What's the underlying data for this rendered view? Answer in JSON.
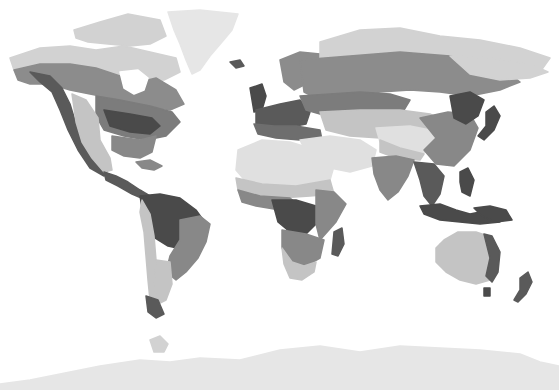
{
  "map": {
    "type": "world-climate-zones-grayscale",
    "background": "#ffffff",
    "palette": {
      "ice": "#e6e6e6",
      "tundra": "#d2d2d2",
      "desert": "#e0e0e0",
      "steppe": "#c4c4c4",
      "temperate": "#9a9a9a",
      "boreal": "#8c8c8c",
      "continental": "#7c7c7c",
      "savanna": "#888888",
      "tropical": "#4a4a4a",
      "mountain": "#5a5a5a",
      "mediterranean": "#6e6e6e"
    },
    "regions": [
      {
        "name": "greenland",
        "zone": "ice",
        "points": "168,12 200,10 238,14 232,30 222,42 210,56 200,70 192,74 186,60 180,44 174,30"
      },
      {
        "name": "canadian-arctic-islands",
        "zone": "tundra",
        "points": "74,30 100,22 128,14 160,20 166,36 150,44 130,46 108,44 88,42 76,38"
      },
      {
        "name": "north-america-tundra",
        "zone": "tundra",
        "points": "10,58 40,48 70,46 96,50 124,46 150,52 176,58 180,72 164,80 140,82 120,76 96,70 70,64 40,66 14,70"
      },
      {
        "name": "north-america-boreal",
        "zone": "boreal",
        "points": "14,70 40,64 70,64 96,68 120,76 140,82 156,78 176,90 184,104 170,110 150,106 130,104 110,98 90,94 70,90 50,84 30,84 18,80"
      },
      {
        "name": "hudson-bay",
        "zone": "water",
        "points": "120,72 138,70 148,78 144,90 134,94 124,88"
      },
      {
        "name": "north-america-continental",
        "zone": "continental",
        "points": "96,96 120,100 150,106 172,112 180,122 166,136 146,140 124,136 104,130 96,116"
      },
      {
        "name": "north-america-east-forest",
        "zone": "tropical",
        "points": "104,110 130,114 152,118 160,126 150,134 130,132 110,126"
      },
      {
        "name": "north-america-pacific-coast",
        "zone": "mountain",
        "points": "30,72 50,76 62,88 70,104 76,124 84,144 96,160 108,170 104,176 90,168 78,150 68,130 60,110 52,92 40,82"
      },
      {
        "name": "north-america-west-desert",
        "zone": "steppe",
        "points": "72,94 86,100 98,118 100,140 110,158 112,170 104,172 92,158 82,142 76,122"
      },
      {
        "name": "north-america-southeast",
        "zone": "savanna",
        "points": "112,136 140,140 156,136 152,152 140,158 124,156 112,150"
      },
      {
        "name": "central-america",
        "zone": "mountain",
        "points": "104,172 116,176 128,182 140,190 150,196 146,200 132,194 118,186 106,180"
      },
      {
        "name": "caribbean",
        "zone": "savanna",
        "points": "136,162 150,160 162,166 154,170 142,168"
      },
      {
        "name": "south-america-amazon",
        "zone": "tropical",
        "points": "140,196 160,194 180,198 196,210 206,224 200,240 186,250 168,246 152,236 144,220"
      },
      {
        "name": "south-america-savanna",
        "zone": "savanna",
        "points": "180,220 200,216 210,224 206,242 198,258 186,272 176,280 166,272 170,256 180,240"
      },
      {
        "name": "south-america-andes",
        "zone": "steppe",
        "points": "142,200 150,214 154,236 156,260 158,284 156,300 150,300 148,280 146,256 144,232 140,212"
      },
      {
        "name": "south-america-patagonia",
        "zone": "steppe",
        "points": "156,260 170,262 172,284 166,300 158,304 154,286"
      },
      {
        "name": "south-america-south-tip",
        "zone": "mountain",
        "points": "146,296 158,300 164,314 156,318 148,312"
      },
      {
        "name": "iceland",
        "zone": "mountain",
        "points": "230,62 240,60 244,66 236,68"
      },
      {
        "name": "scandinavia",
        "zone": "boreal",
        "points": "280,60 300,52 320,54 316,70 306,84 294,90 284,82"
      },
      {
        "name": "british-isles",
        "zone": "tropical",
        "points": "250,88 262,84 266,96 262,110 254,112 252,100"
      },
      {
        "name": "western-europe",
        "zone": "mountain",
        "points": "256,110 280,104 300,100 310,112 306,124 286,128 266,130 256,124"
      },
      {
        "name": "mediterranean-europe",
        "zone": "mediterranean",
        "points": "254,124 274,126 296,126 320,130 322,140 300,140 276,138 258,134"
      },
      {
        "name": "russia-tundra",
        "zone": "tundra",
        "points": "320,42 360,30 400,28 440,36 480,40 520,48 550,58 540,72 510,74 480,66 450,58 420,54 380,54 350,56 320,60"
      },
      {
        "name": "russia-boreal",
        "zone": "boreal",
        "points": "300,60 350,56 400,52 450,56 480,66 510,74 520,82 500,90 470,96 440,92 410,90 380,92 350,98 320,100 304,92"
      },
      {
        "name": "russia-east-tundra",
        "zone": "tundra",
        "points": "450,56 490,58 530,64 548,72 530,78 500,80 470,74"
      },
      {
        "name": "eastern-europe-continental",
        "zone": "continental",
        "points": "300,96 330,94 360,92 390,94 410,100 404,110 380,110 350,112 320,114 306,110"
      },
      {
        "name": "central-asia-steppe",
        "zone": "steppe",
        "points": "320,112 360,110 400,110 430,114 450,124 440,136 410,134 380,138 350,136 326,130"
      },
      {
        "name": "middle-east-desert",
        "zone": "desert",
        "points": "300,140 330,136 360,140 376,150 372,166 350,172 330,168 310,160"
      },
      {
        "name": "tibet-plateau",
        "zone": "desert",
        "points": "376,128 410,126 440,132 444,146 420,154 396,150 380,142"
      },
      {
        "name": "himalaya",
        "zone": "steppe",
        "points": "380,140 400,148 424,154 420,160 396,158 380,152"
      },
      {
        "name": "china-east",
        "zone": "savanna",
        "points": "420,118 448,112 470,114 478,128 470,150 454,166 436,164 424,150 436,138"
      },
      {
        "name": "manchuria-korea",
        "zone": "tropical",
        "points": "450,96 470,92 484,100 478,116 466,124 454,118"
      },
      {
        "name": "japan",
        "zone": "tropical",
        "points": "486,112 494,106 500,116 494,130 484,140 478,136 486,126"
      },
      {
        "name": "india",
        "zone": "savanna",
        "points": "372,158 396,156 414,160 408,176 398,192 388,200 380,190 374,174"
      },
      {
        "name": "southeast-asia",
        "zone": "mountain",
        "points": "414,162 434,164 444,176 440,194 432,206 424,196 420,180"
      },
      {
        "name": "indonesia",
        "zone": "tropical",
        "points": "420,206 440,204 456,210 470,214 480,212 496,216 500,222 480,224 460,222 440,220 424,214"
      },
      {
        "name": "philippines",
        "zone": "tropical",
        "points": "460,172 468,168 474,180 470,196 462,192 460,182"
      },
      {
        "name": "new-guinea",
        "zone": "tropical",
        "points": "474,208 490,206 506,210 512,220 496,222 482,216"
      },
      {
        "name": "north-africa-desert",
        "zone": "desert",
        "points": "238,150 262,140 290,142 316,150 334,166 330,180 300,186 270,188 248,184 236,170"
      },
      {
        "name": "west-africa-sahel",
        "zone": "steppe",
        "points": "236,178 262,184 296,186 330,180 334,194 310,196 280,198 252,196 238,190"
      },
      {
        "name": "west-africa-savanna",
        "zone": "savanna",
        "points": "238,190 260,196 290,198 300,206 280,210 256,206 242,202"
      },
      {
        "name": "central-africa-tropical",
        "zone": "tropical",
        "points": "272,200 296,200 316,206 316,224 306,234 290,232 278,222"
      },
      {
        "name": "east-africa",
        "zone": "savanna",
        "points": "316,190 334,192 346,204 336,222 320,240 316,224"
      },
      {
        "name": "southern-africa-savanna",
        "zone": "savanna",
        "points": "282,230 306,234 324,240 320,258 306,266 290,262 282,248"
      },
      {
        "name": "southern-africa-desert",
        "zone": "steppe",
        "points": "282,248 292,262 304,266 316,262 314,272 302,280 290,278 284,264"
      },
      {
        "name": "madagascar",
        "zone": "mountain",
        "points": "334,232 342,228 344,244 338,256 332,254"
      },
      {
        "name": "australia-interior",
        "zone": "desert",
        "points": "440,244 456,236 472,236 486,244 488,262 476,272 458,270 442,262"
      },
      {
        "name": "australia-coast",
        "zone": "steppe",
        "points": "436,248 444,240 458,232 476,232 488,236 498,248 498,268 490,280 476,284 460,280 446,272 436,262"
      },
      {
        "name": "australia-east-coast",
        "zone": "mountain",
        "points": "484,234 492,236 500,252 498,272 492,282 486,276 490,258"
      },
      {
        "name": "tasmania",
        "zone": "tropical",
        "points": "484,288 490,288 490,296 484,296"
      },
      {
        "name": "new-zealand",
        "zone": "mountain",
        "points": "520,278 528,272 532,282 526,294 518,302 514,300 520,290"
      },
      {
        "name": "antarctica",
        "zone": "ice",
        "points": "0,384 30,380 70,372 100,366 140,360 170,362 200,358 240,360 280,350 320,346 360,352 400,346 440,348 480,350 520,354 540,362 559,366 559,390 0,390"
      },
      {
        "name": "antarctic-peninsula",
        "zone": "tundra",
        "points": "150,340 160,336 168,344 164,352 154,352"
      }
    ]
  }
}
